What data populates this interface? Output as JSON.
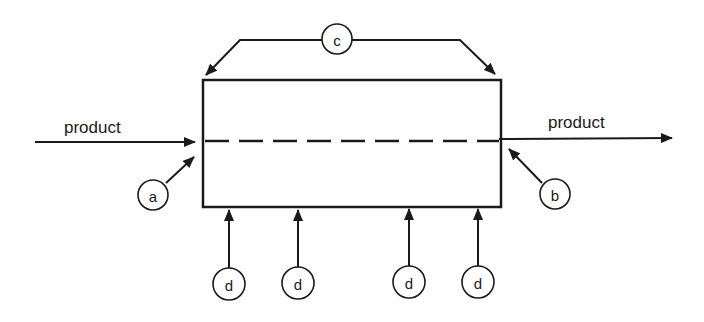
{
  "diagram": {
    "type": "process schematic",
    "colors": {
      "stroke": "#1a1a1a",
      "background": "#ffffff"
    },
    "flow_labels": {
      "inlet": "product",
      "outlet": "product"
    },
    "markers": {
      "a": "a",
      "b": "b",
      "c": "c",
      "d1": "d",
      "d2": "d",
      "d3": "d",
      "d4": "d"
    },
    "box": {
      "x": 203,
      "y": 80,
      "width": 298,
      "height": 127
    }
  }
}
